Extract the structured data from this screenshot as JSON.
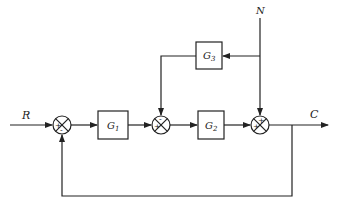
{
  "diagram": {
    "input_label": "R",
    "output_label": "C",
    "disturbance_label": "N",
    "blocks": [
      {
        "id": "G1",
        "label": "G",
        "sub": "1"
      },
      {
        "id": "G2",
        "label": "G",
        "sub": "2"
      },
      {
        "id": "G3",
        "label": "G",
        "sub": "3"
      }
    ],
    "summing_junctions": [
      {
        "id": "S1",
        "signs": [
          "+",
          "-"
        ]
      },
      {
        "id": "S2",
        "signs": [
          "+",
          "-"
        ]
      },
      {
        "id": "S3",
        "signs": [
          "+",
          "+"
        ]
      }
    ],
    "line_color": "#222222"
  }
}
